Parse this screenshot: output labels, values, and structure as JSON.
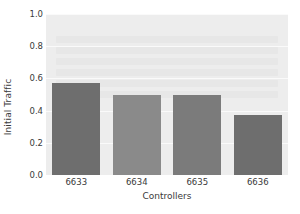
{
  "chart_data": {
    "type": "bar",
    "title": "",
    "xlabel": "Controllers",
    "ylabel": "Initial Traffic",
    "categories": [
      "6633",
      "6634",
      "6635",
      "6636"
    ],
    "values": [
      0.57,
      0.5,
      0.5,
      0.37
    ],
    "bar_colors": [
      "#6e6e6e",
      "#8a8a8a",
      "#7b7b7b",
      "#6e6e6e"
    ],
    "ylim": [
      0.0,
      1.0
    ],
    "yticks": [
      0.0,
      0.2,
      0.4,
      0.6,
      0.8,
      1.0
    ],
    "ytick_labels": [
      "0.0",
      "0.2",
      "0.4",
      "0.6",
      "0.8",
      "1.0"
    ],
    "grid": true,
    "grid_axis": "y",
    "legend": null,
    "plot_background": "#ededed",
    "figure_background": "#ffffff",
    "gridline_color": "#fafafa",
    "text_color": "#3a3a3a"
  }
}
